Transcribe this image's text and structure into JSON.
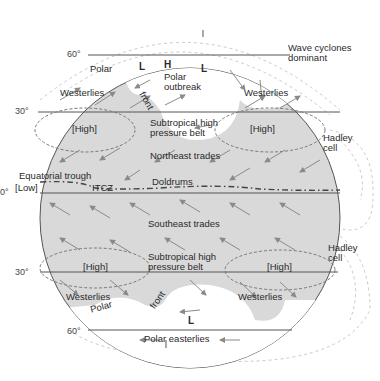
{
  "diagram": {
    "colors": {
      "background": "#ffffff",
      "globe_fill": "#d9d9d9",
      "polar_fill": "#ffffff",
      "lines": "#555555",
      "arrows": "#8a8a8a",
      "dashed_outline": "#999999"
    },
    "latitudes": {
      "n60": "60°",
      "n30": "30°",
      "eq": "0°",
      "s30": "30°",
      "s60": "60°"
    },
    "north": {
      "polar": "Polar",
      "low_left": "L",
      "high": "H",
      "low_right": "L",
      "polar_outbreak_1": "Polar",
      "polar_outbreak_2": "outbreak",
      "front": "front",
      "westerlies_left": "Westerlies",
      "westerlies_right": "Westerlies",
      "high_left": "[High]",
      "high_right": "[High]",
      "subtropical_1": "Subtropical high",
      "subtropical_2": "pressure belt",
      "trades": "Northeast trades"
    },
    "equator": {
      "trough": "Equatorial trough",
      "low": "[Low]",
      "itcz": "ITCZ",
      "doldrums": "Doldrums"
    },
    "south": {
      "trades": "Southeast trades",
      "subtropical_1": "Subtropical high",
      "subtropical_2": "pressure belt",
      "high_left": "[High]",
      "high_right": "[High]",
      "westerlies_left": "Westerlies",
      "polar": "Polar",
      "front": "front",
      "westerlies_right": "Westerlies",
      "low": "L",
      "polar_easterlies": "Polar easterlies"
    },
    "side": {
      "wave_1": "Wave cyclones",
      "wave_2": "dominant",
      "hadley_n_1": "Hadley",
      "hadley_n_2": "cell",
      "hadley_s_1": "Hadley",
      "hadley_s_2": "cell"
    }
  }
}
